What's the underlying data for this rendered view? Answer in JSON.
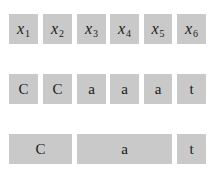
{
  "diagram": {
    "row1": {
      "cells": [
        {
          "var": "x",
          "sub": "1"
        },
        {
          "var": "x",
          "sub": "2"
        },
        {
          "var": "x",
          "sub": "3"
        },
        {
          "var": "x",
          "sub": "4"
        },
        {
          "var": "x",
          "sub": "5"
        },
        {
          "var": "x",
          "sub": "6"
        }
      ]
    },
    "row2": {
      "cells": [
        "C",
        "C",
        "a",
        "a",
        "a",
        "t"
      ]
    },
    "row3": {
      "segments": [
        {
          "label": "C",
          "span": 2
        },
        {
          "label": "a",
          "span": 3
        },
        {
          "label": "t",
          "span": 1
        }
      ]
    },
    "colors": {
      "box_fill": "#c9c9c9",
      "text": "#1a1a1a"
    }
  }
}
